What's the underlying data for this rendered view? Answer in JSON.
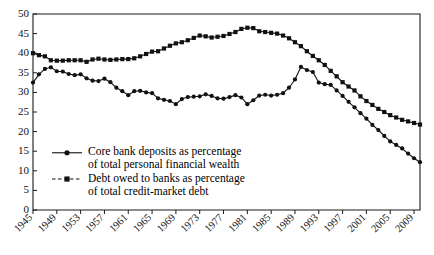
{
  "chart_data": {
    "type": "line",
    "title": "",
    "xlabel": "",
    "ylabel": "",
    "ylim": [
      0,
      50
    ],
    "xlim": [
      1945,
      2010
    ],
    "grid": false,
    "legend_position": "inside-lower-left",
    "ytick_labels": [
      "0",
      "5",
      "10",
      "15",
      "20",
      "25",
      "30",
      "35",
      "40",
      "45",
      "50"
    ],
    "ytick_values": [
      0,
      5,
      10,
      15,
      20,
      25,
      30,
      35,
      40,
      45,
      50
    ],
    "xtick_labels": [
      "1945",
      "1949",
      "1953",
      "1957",
      "1961",
      "1965",
      "1969",
      "1973",
      "1977",
      "1981",
      "1985",
      "1989",
      "1993",
      "1997",
      "2001",
      "2005",
      "2009"
    ],
    "xtick_values": [
      1945,
      1949,
      1953,
      1957,
      1961,
      1965,
      1969,
      1973,
      1977,
      1981,
      1985,
      1989,
      1993,
      1997,
      2001,
      2005,
      2009
    ],
    "x": [
      1945,
      1946,
      1947,
      1948,
      1949,
      1950,
      1951,
      1952,
      1953,
      1954,
      1955,
      1956,
      1957,
      1958,
      1959,
      1960,
      1961,
      1962,
      1963,
      1964,
      1965,
      1966,
      1967,
      1968,
      1969,
      1970,
      1971,
      1972,
      1973,
      1974,
      1975,
      1976,
      1977,
      1978,
      1979,
      1980,
      1981,
      1982,
      1983,
      1984,
      1985,
      1986,
      1987,
      1988,
      1989,
      1990,
      1991,
      1992,
      1993,
      1994,
      1995,
      1996,
      1997,
      1998,
      1999,
      2000,
      2001,
      2002,
      2003,
      2004,
      2005,
      2006,
      2007,
      2008,
      2009,
      2010
    ],
    "series": [
      {
        "name": "Core bank deposits as percentage of total personal financial wealth",
        "marker": "circle",
        "linestyle": "solid",
        "values": [
          32.5,
          34.6,
          36.0,
          36.4,
          35.4,
          35.3,
          34.7,
          34.4,
          34.6,
          33.6,
          33.0,
          32.9,
          33.5,
          32.6,
          31.2,
          30.3,
          29.3,
          30.3,
          30.4,
          30.0,
          29.8,
          28.5,
          28.1,
          27.8,
          27.0,
          28.3,
          28.8,
          28.9,
          29.0,
          29.5,
          29.1,
          28.5,
          28.4,
          28.8,
          29.3,
          28.7,
          27.0,
          28.0,
          29.2,
          29.4,
          29.2,
          29.4,
          29.8,
          31.2,
          33.3,
          36.5,
          35.7,
          35.2,
          32.5,
          32.1,
          31.9,
          30.5,
          29.1,
          27.6,
          26.2,
          24.7,
          23.3,
          21.7,
          20.4,
          18.9,
          17.5,
          16.6,
          15.7,
          14.4,
          13.2,
          12.2
        ]
      },
      {
        "name": "Debt owed to banks as percentage of total credit-market debt",
        "marker": "square",
        "linestyle": "solid",
        "values": [
          40.0,
          39.5,
          39.2,
          38.2,
          38.1,
          38.1,
          38.2,
          38.2,
          38.2,
          37.8,
          38.4,
          38.6,
          38.4,
          38.3,
          38.4,
          38.5,
          38.5,
          38.7,
          39.2,
          39.8,
          40.4,
          40.5,
          41.2,
          41.9,
          42.5,
          42.8,
          43.3,
          43.9,
          44.5,
          44.3,
          44.0,
          44.2,
          44.4,
          44.9,
          45.4,
          46.2,
          46.5,
          46.4,
          45.6,
          45.4,
          45.2,
          45.0,
          44.5,
          43.8,
          42.8,
          41.8,
          40.5,
          39.3,
          38.2,
          37.0,
          35.5,
          34.1,
          32.6,
          31.5,
          30.5,
          29.0,
          27.8,
          26.8,
          25.8,
          25.0,
          24.2,
          23.6,
          23.0,
          22.6,
          22.2,
          21.8
        ]
      }
    ],
    "legend": [
      {
        "marker": "circle",
        "linestyle": "solid",
        "line1": "Core bank deposits as percentage",
        "line2": "of total personal financial wealth"
      },
      {
        "marker": "square",
        "linestyle": "dashed",
        "line1": "Debt owed to banks as percentage",
        "line2": "of total credit-market debt"
      }
    ],
    "colors": {
      "series": "#111111",
      "axis": "#1a1a1a",
      "background": "#ffffff"
    }
  }
}
